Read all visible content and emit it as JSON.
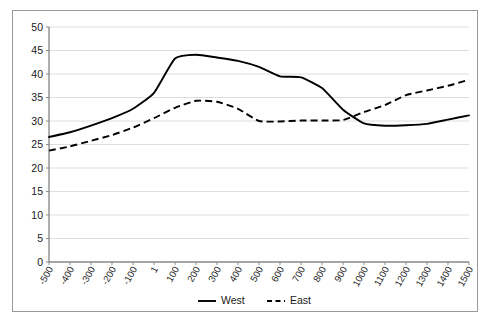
{
  "chart_data": {
    "type": "line",
    "title": "",
    "xlabel": "",
    "ylabel": "",
    "ylim": [
      0,
      50
    ],
    "ytick_step": 5,
    "grid": true,
    "legend_position": "bottom",
    "categories": [
      "-500",
      "-400",
      "-300",
      "-200",
      "-100",
      "1",
      "100",
      "200",
      "300",
      "400",
      "500",
      "600",
      "700",
      "800",
      "900",
      "1000",
      "1100",
      "1200",
      "1300",
      "1400",
      "1500"
    ],
    "yticks": [
      "0",
      "5",
      "10",
      "15",
      "20",
      "25",
      "30",
      "35",
      "40",
      "45",
      "50"
    ],
    "series": [
      {
        "name": "West",
        "style": "solid",
        "color": "#000000",
        "values": [
          26.6,
          27.6,
          29.0,
          30.6,
          32.6,
          36.0,
          43.3,
          44.1,
          43.5,
          42.8,
          41.5,
          39.5,
          39.3,
          37.0,
          32.4,
          29.5,
          29.0,
          29.1,
          29.4,
          30.3,
          31.2
        ]
      },
      {
        "name": "East",
        "style": "dashed",
        "color": "#000000",
        "values": [
          23.7,
          24.6,
          25.8,
          27.0,
          28.6,
          30.6,
          32.8,
          34.3,
          34.1,
          32.6,
          30.0,
          29.9,
          30.1,
          30.1,
          30.2,
          31.9,
          33.4,
          35.5,
          36.5,
          37.5,
          38.8
        ]
      }
    ],
    "extra_points": {
      "west_tail": [
        32.0,
        33.5,
        32.3,
        30.2,
        31.5,
        33.8
      ],
      "east_tail": [
        40.5,
        41.3,
        42.5,
        43.0,
        42.0,
        39.2,
        36.5,
        38.2,
        40.1
      ]
    }
  },
  "legend": {
    "items": [
      {
        "label": "West",
        "style": "solid"
      },
      {
        "label": "East",
        "style": "dashed"
      }
    ]
  }
}
